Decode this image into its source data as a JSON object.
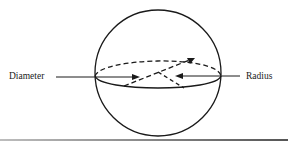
{
  "figure": {
    "type": "sphere-diagram",
    "labels": {
      "diameter": "Diameter",
      "radius": "Radius"
    },
    "colors": {
      "stroke": "#1a1a1a",
      "background": "#ffffff"
    }
  }
}
